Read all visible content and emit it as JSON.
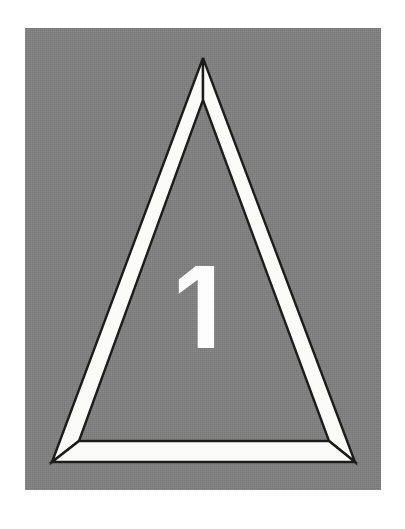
{
  "figure": {
    "caption_number": "1",
    "plate": {
      "background_color": "#808080",
      "page_color": "#ffffff",
      "left": 25,
      "top": 28,
      "width": 356,
      "height": 462
    },
    "shape": {
      "name": "triangle-outline",
      "description": "Equilateral-style triangle drawn as three tapered white bands with dark outlines",
      "band_color": "#fbfbf9",
      "outline_color": "#1c1c1c",
      "outer": {
        "apex": [
          203,
          58
        ],
        "bottom_left": [
          52,
          462
        ],
        "bottom_right": [
          355,
          462
        ]
      },
      "inner": {
        "apex": [
          203,
          100
        ],
        "bottom_left": [
          79,
          441
        ],
        "bottom_right": [
          329,
          441
        ]
      }
    },
    "label": {
      "text": "1",
      "color": "#fdfdfd",
      "center_x": 203,
      "center_y": 307,
      "cap_height": 82
    }
  }
}
